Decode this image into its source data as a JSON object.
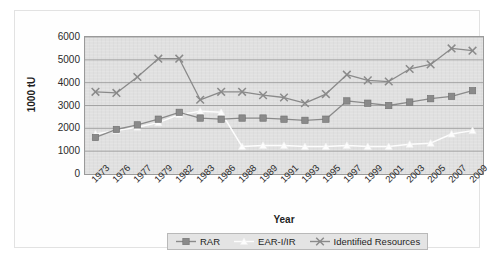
{
  "chart_data": {
    "type": "line",
    "title": "",
    "xlabel": "Year",
    "ylabel": "1000 tU",
    "ylim": [
      0,
      6000
    ],
    "ytick_step": 1000,
    "yticks": [
      "0",
      "1000",
      "2000",
      "3000",
      "4000",
      "5000",
      "6000"
    ],
    "grid": true,
    "legend_position": "bottom",
    "plot_background": "#e0e0e0",
    "categories": [
      "1973",
      "1976",
      "1977",
      "1979",
      "1982",
      "1983",
      "1986",
      "1988",
      "1989",
      "1991",
      "1993",
      "1995",
      "1997",
      "1999",
      "2001",
      "2003",
      "2005",
      "2007",
      "2009"
    ],
    "series": [
      {
        "name": "RAR",
        "marker": "square",
        "color": "#8a8a8a",
        "values": [
          1600,
          1950,
          2150,
          2400,
          2700,
          2450,
          2400,
          2450,
          2450,
          2400,
          2350,
          2400,
          3200,
          3100,
          3000,
          3150,
          3300,
          3400,
          3650
        ]
      },
      {
        "name": "EAR-I/IR",
        "marker": "triangle",
        "color": "#fdfdfd",
        "values": [
          1750,
          1900,
          2050,
          2250,
          2600,
          2750,
          2700,
          1200,
          1250,
          1250,
          1200,
          1200,
          1250,
          1200,
          1200,
          1300,
          1350,
          1750,
          1900
        ]
      },
      {
        "name": "Identified Resources",
        "marker": "cross",
        "color": "#8a8a8a",
        "values": [
          3600,
          3550,
          4250,
          5050,
          5050,
          3250,
          3600,
          3600,
          3450,
          3350,
          3100,
          3500,
          4350,
          4100,
          4050,
          4600,
          4800,
          5500,
          5400
        ]
      }
    ]
  },
  "axes": {
    "y_title": "1000 tU",
    "x_title": "Year"
  },
  "legend": {
    "items": [
      {
        "label": "RAR",
        "marker": "square-line-marker"
      },
      {
        "label": "EAR-I/IR",
        "marker": "triangle-line-marker"
      },
      {
        "label": "Identified Resources",
        "marker": "cross-line-marker"
      }
    ]
  }
}
